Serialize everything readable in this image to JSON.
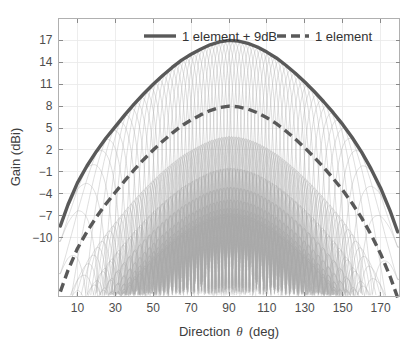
{
  "chart_data": {
    "type": "line",
    "title": "",
    "xlabel": "Direction θ (deg)",
    "xlabel_parts": {
      "pre": "Direction",
      "symbol": "θ",
      "post": "(deg)"
    },
    "ylabel": "Gain (dBi)",
    "xlim": [
      0,
      180
    ],
    "ylim": [
      -18,
      20
    ],
    "xticks": [
      10,
      30,
      50,
      70,
      90,
      110,
      130,
      150,
      170
    ],
    "yticks": [
      17,
      14,
      11,
      8,
      5,
      2,
      -1,
      -4,
      -7,
      -10
    ],
    "grid": true,
    "legend_position": "top-center",
    "colors": {
      "envelope": "#595959",
      "beams": "#a8a8a8",
      "grid": "#e8e8e8",
      "axis": "#b0b0b0",
      "text": "#4d4d4d"
    },
    "series": [
      {
        "name": "1 element + 9dB",
        "style": "solid",
        "peak_value": 17,
        "peak_at_deg": 90,
        "offset_db": 9,
        "x": [
          1,
          5,
          10,
          15,
          20,
          25,
          30,
          35,
          40,
          45,
          50,
          55,
          60,
          65,
          70,
          75,
          80,
          85,
          90,
          95,
          100,
          105,
          110,
          115,
          120,
          125,
          130,
          135,
          140,
          145,
          150,
          155,
          160,
          165,
          170,
          175,
          179
        ],
        "values": [
          -8.4,
          -5.5,
          -2.5,
          -0.2,
          1.8,
          3.6,
          5.2,
          6.8,
          8.3,
          9.7,
          11.0,
          12.2,
          13.3,
          14.3,
          15.1,
          15.8,
          16.4,
          16.8,
          17.0,
          16.9,
          16.6,
          16.1,
          15.4,
          14.6,
          13.6,
          12.5,
          11.3,
          10.0,
          8.6,
          7.1,
          5.5,
          3.7,
          1.7,
          -0.6,
          -3.2,
          -6.3,
          -9.2
        ]
      },
      {
        "name": "1 element",
        "style": "dashed",
        "peak_value": 8,
        "peak_at_deg": 90,
        "offset_db": 0,
        "x": [
          1,
          5,
          10,
          15,
          20,
          25,
          30,
          35,
          40,
          45,
          50,
          55,
          60,
          65,
          70,
          75,
          80,
          85,
          90,
          95,
          100,
          105,
          110,
          115,
          120,
          125,
          130,
          135,
          140,
          145,
          150,
          155,
          160,
          165,
          170,
          175,
          179
        ],
        "values": [
          -17.4,
          -14.5,
          -11.5,
          -9.2,
          -7.2,
          -5.4,
          -3.8,
          -2.2,
          -0.7,
          0.7,
          2.0,
          3.2,
          4.3,
          5.3,
          6.1,
          6.8,
          7.4,
          7.8,
          8.0,
          7.9,
          7.6,
          7.1,
          6.4,
          5.6,
          4.6,
          3.5,
          2.3,
          1.0,
          -0.4,
          -1.9,
          -3.5,
          -5.3,
          -7.3,
          -9.6,
          -12.2,
          -15.3,
          -18.2
        ]
      }
    ],
    "beam_family": {
      "description": "Array beamforming patterns: many narrow beams steered across 0-180 deg, each modulated by the element pattern envelope",
      "num_beams": 64,
      "peak_envelope_db": 17,
      "sidelobe_floor_db": -18
    },
    "legend": [
      {
        "label": "1 element + 9dB",
        "style": "solid",
        "color": "#595959"
      },
      {
        "label": "1 element",
        "style": "dashed",
        "color": "#595959"
      }
    ]
  }
}
